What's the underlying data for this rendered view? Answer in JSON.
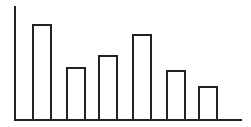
{
  "chart_data": {
    "type": "bar",
    "title": "",
    "xlabel": "",
    "ylabel": "",
    "categories": [
      "1",
      "2",
      "3",
      "4",
      "5",
      "6"
    ],
    "values": [
      95,
      52,
      64,
      85,
      49,
      33
    ],
    "ylim": [
      0,
      114
    ],
    "grid": false,
    "legend": null,
    "tick_labels_visible": false,
    "style": {
      "bar_fill": "#ffffff",
      "bar_stroke": "#222222",
      "axis_color": "#222222",
      "background": "#ffffff"
    }
  }
}
